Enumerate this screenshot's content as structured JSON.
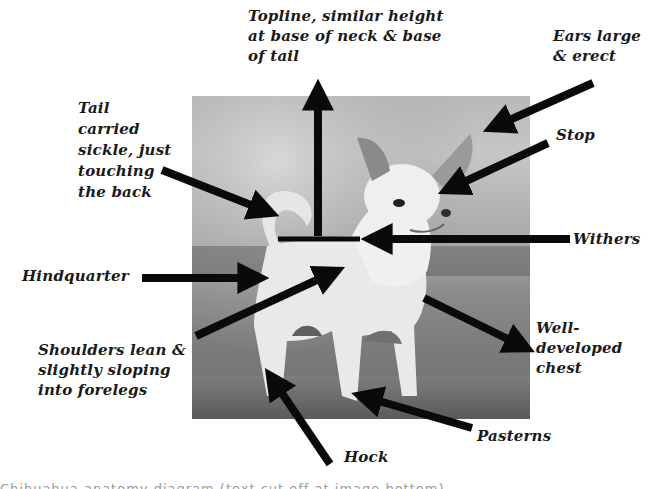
{
  "diagram": {
    "labels": [
      {
        "id": "topline",
        "text": "Topline, similar height\nat base of neck & base\nof tail"
      },
      {
        "id": "ears",
        "text": "Ears large\n& erect"
      },
      {
        "id": "tail",
        "text": "Tail\ncarried\nsickle, just\ntouching\nthe back"
      },
      {
        "id": "stop",
        "text": "Stop"
      },
      {
        "id": "withers",
        "text": "Withers"
      },
      {
        "id": "hindquarter",
        "text": "Hindquarter"
      },
      {
        "id": "shoulders",
        "text": "Shoulders lean &\nslightly sloping\ninto forelegs"
      },
      {
        "id": "chest",
        "text": "Well-\ndeveloped\nchest"
      },
      {
        "id": "pasterns",
        "text": "Pasterns"
      },
      {
        "id": "hock",
        "text": "Hock"
      }
    ],
    "colors": {
      "arrow": "#0a0a0a",
      "text": "#1a1a1a",
      "background": "#ffffff"
    },
    "footer_cutoff": "Chihuahua anatomy diagram (text cut off at image bottom)"
  }
}
